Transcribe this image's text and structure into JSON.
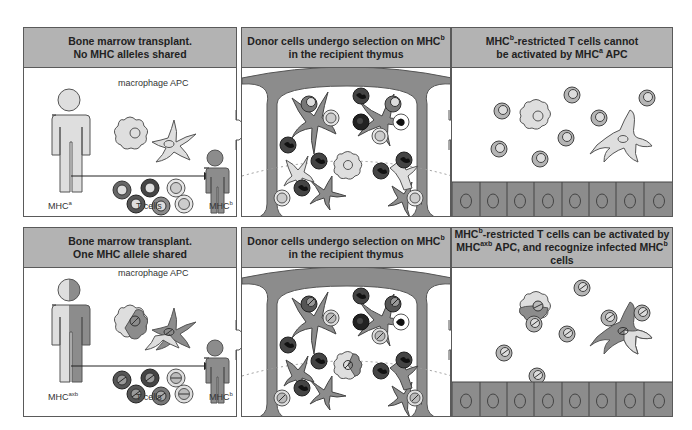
{
  "colors": {
    "header_bg": "#b3b3b3",
    "border": "#5a5a5a",
    "light_gray": "#dedede",
    "mid_gray": "#8c8c8c",
    "dark_gray": "#555555",
    "black_cell": "#2a2a2a"
  },
  "rows": [
    {
      "panels": [
        {
          "title_line1": "Bone marrow transplant.",
          "title_line2": "No MHC alleles shared",
          "labels": {
            "macrophage": "macrophage",
            "apc": "APC",
            "t_cells": "T cells",
            "donor": "MHC",
            "donor_sup": "a",
            "recipient": "MHC",
            "recipient_sup": "b"
          }
        },
        {
          "title_line1_pre": "Donor cells undergo selection on MHC",
          "title_line1_sup": "b",
          "title_line2": "in the recipient thymus"
        },
        {
          "title_line1_pre": "MHC",
          "title_line1_sup": "b",
          "title_line1_post": "-restricted  T  cells  cannot",
          "title_line2_pre": "be  activated  by  MHC",
          "title_line2_sup": "a",
          "title_line2_post": " APC"
        }
      ]
    },
    {
      "panels": [
        {
          "title_line1": "Bone marrow transplant.",
          "title_line2": "One MHC allele shared",
          "labels": {
            "macrophage": "macrophage",
            "apc": "APC",
            "t_cells": "T cells",
            "donor": "MHC",
            "donor_sup": "axb",
            "recipient": "MHC",
            "recipient_sup": "b"
          }
        },
        {
          "title_line1_pre": "Donor cells undergo selection on MHC",
          "title_line1_sup": "b",
          "title_line2": "in the recipient thymus"
        },
        {
          "title_line1_pre": "MHC",
          "title_line1_sup": "b",
          "title_line1_post": "-restricted  T  cells  can  be  activated  by",
          "title_line2_pre": "MHC",
          "title_line2_sup": "axb",
          "title_line2_mid": " APC,  and  recognize  infected  MHC",
          "title_line2_sup2": "b",
          "title_line2_post": " cells"
        }
      ]
    }
  ]
}
